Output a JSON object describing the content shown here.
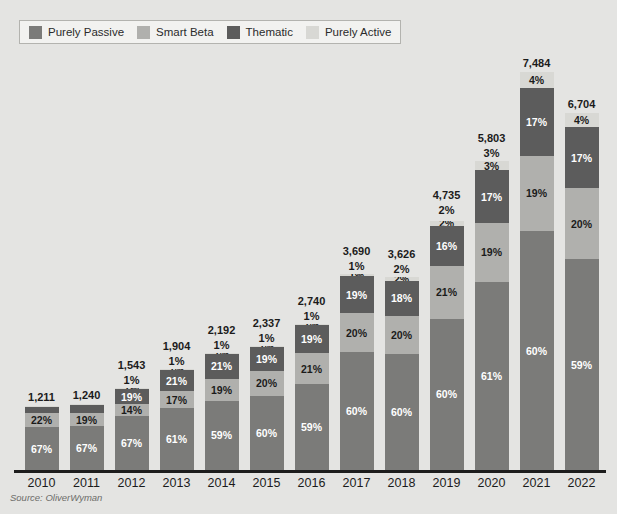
{
  "source_note": "Source: OliverWyman",
  "top_cut_text": "",
  "colors": {
    "purely_passive": "#7b7b79",
    "smart_beta": "#b0b0ad",
    "thematic": "#5c5c5c",
    "purely_active": "#d8d8d4",
    "background": "#e4e4e2",
    "axis": "#1d1d1d",
    "label_dark": "#1b1b1b",
    "label_light": "#ffffff"
  },
  "legend": {
    "items": [
      {
        "label": "Purely Passive",
        "color_key": "purely_passive",
        "swatch": "legend-swatch-purely-passive"
      },
      {
        "label": "Smart Beta",
        "color_key": "smart_beta",
        "swatch": "legend-swatch-smart-beta"
      },
      {
        "label": "Thematic",
        "color_key": "thematic",
        "swatch": "legend-swatch-thematic"
      },
      {
        "label": "Purely Active",
        "color_key": "purely_active",
        "swatch": "legend-swatch-purely-active"
      }
    ]
  },
  "chart_data": {
    "type": "bar",
    "subtype": "stacked-percentage-with-totals",
    "title": "",
    "xlabel": "",
    "ylabel": "",
    "grid": false,
    "legend_position": "top-left",
    "categories": [
      "2010",
      "2011",
      "2012",
      "2013",
      "2014",
      "2015",
      "2016",
      "2017",
      "2018",
      "2019",
      "2020",
      "2021",
      "2022"
    ],
    "totals": [
      1211,
      1240,
      1543,
      1904,
      2192,
      2337,
      2740,
      3690,
      3626,
      4735,
      5803,
      7484,
      6704
    ],
    "totals_formatted": [
      "1,211",
      "1,240",
      "1,543",
      "1,904",
      "2,192",
      "2,337",
      "2,740",
      "3,690",
      "3,626",
      "4,735",
      "5,803",
      "7,484",
      "6,704"
    ],
    "series": [
      {
        "name": "Purely Passive",
        "color": "#7b7b79",
        "values": [
          67,
          67,
          67,
          61,
          59,
          60,
          59,
          60,
          60,
          60,
          61,
          60,
          59
        ],
        "labels": [
          "67%",
          "67%",
          "67%",
          "61%",
          "59%",
          "60%",
          "59%",
          "60%",
          "60%",
          "60%",
          "61%",
          "60%",
          "59%"
        ]
      },
      {
        "name": "Smart Beta",
        "color": "#b0b0ad",
        "values": [
          22,
          19,
          14,
          17,
          19,
          20,
          21,
          20,
          20,
          21,
          19,
          19,
          20
        ],
        "labels": [
          "22%",
          "19%",
          "14%",
          "17%",
          "19%",
          "20%",
          "21%",
          "20%",
          "20%",
          "21%",
          "19%",
          "19%",
          "20%"
        ]
      },
      {
        "name": "Thematic",
        "color": "#5c5c5c",
        "values": [
          10,
          13,
          19,
          21,
          21,
          19,
          19,
          19,
          18,
          16,
          17,
          17,
          17
        ],
        "labels": [
          "",
          "",
          "19%",
          "21%",
          "21%",
          "19%",
          "19%",
          "19%",
          "18%",
          "16%",
          "17%",
          "17%",
          "17%"
        ]
      },
      {
        "name": "Purely Active",
        "color": "#d8d8d4",
        "values": [
          1,
          1,
          1,
          1,
          1,
          1,
          1,
          1,
          2,
          2,
          3,
          4,
          4
        ],
        "labels": [
          "",
          "",
          "1%",
          "1%",
          "1%",
          "1%",
          "1%",
          "1%",
          "2%",
          "2%",
          "3%",
          "4%",
          "4%"
        ]
      }
    ],
    "outside_top_labels": [
      "",
      "",
      "1%",
      "1%",
      "1%",
      "1%",
      "1%",
      "1%",
      "2%",
      "2%",
      "3%",
      "",
      ""
    ],
    "inside_top_labels": [
      "",
      "",
      "",
      "",
      "",
      "",
      "",
      "",
      "",
      "",
      "",
      "4%",
      "4%"
    ],
    "value_unit": "",
    "ylim": [
      0,
      7484
    ],
    "note": "Bar heights scale with totals; segment heights are the percentage split of each year's total."
  }
}
